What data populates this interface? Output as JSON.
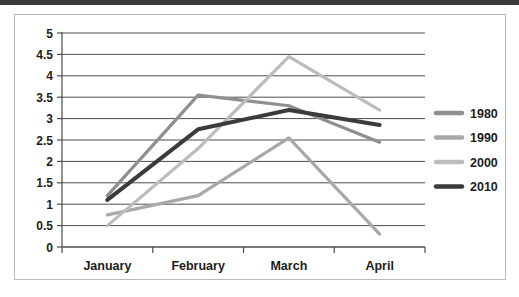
{
  "chart_data": {
    "type": "line",
    "title": "",
    "subtitle": "",
    "xlabel": "",
    "ylabel": "",
    "categories": [
      "January",
      "February",
      "March",
      "April"
    ],
    "ylim": [
      0,
      5
    ],
    "ytick_step": 0.5,
    "yticks": [
      "5",
      "4.5",
      "4",
      "3.5",
      "3",
      "2.5",
      "2",
      "1.5",
      "1",
      "0.5",
      "0"
    ],
    "ytick_values": [
      5,
      4.5,
      4,
      3.5,
      3,
      2.5,
      2,
      1.5,
      1,
      0.5,
      0
    ],
    "grid": true,
    "grid_axis": "y",
    "legend_position": "right",
    "series": [
      {
        "name": "1980",
        "color": "#8f8f8f",
        "width": 3.2,
        "values": [
          1.2,
          3.55,
          3.3,
          2.45
        ]
      },
      {
        "name": "1990",
        "color": "#a8a8a8",
        "width": 3.2,
        "values": [
          0.75,
          1.2,
          2.55,
          0.3
        ]
      },
      {
        "name": "2000",
        "color": "#bcbcbc",
        "width": 3.2,
        "values": [
          0.5,
          2.3,
          4.45,
          3.2
        ]
      },
      {
        "name": "2010",
        "color": "#3b3b3b",
        "width": 4.0,
        "values": [
          1.1,
          2.75,
          3.2,
          2.85
        ]
      }
    ]
  },
  "figure": {
    "border_color": "#b9b9b9",
    "background": "#ffffff",
    "axis_color": "#4d4d4d",
    "text_color": "#1c1c1c"
  }
}
